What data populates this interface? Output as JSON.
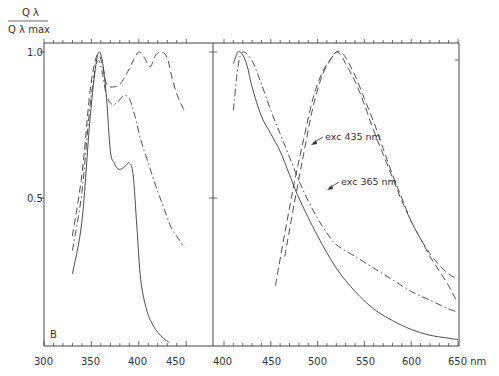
{
  "chart_data": {
    "type": "line",
    "title": "",
    "panel_label": "B",
    "ylabel": {
      "numerator": "Q λ",
      "denominator": "Q λ max"
    },
    "xlabel_unit": "nm",
    "yticks": [
      {
        "value": 1.0,
        "label": "1.0"
      },
      {
        "value": 0.5,
        "label": "0.5"
      }
    ],
    "ylim": [
      0,
      1.03
    ],
    "grid": false,
    "legend": "none (inline annotations)",
    "panels": [
      {
        "name": "excitation",
        "xlim": [
          300,
          460
        ],
        "xticks": [
          300,
          350,
          400,
          450
        ],
        "series": [
          {
            "name": "solid",
            "style": "solid",
            "x": [
              330,
              340,
              348,
              354,
              358,
              362,
              366,
              370,
              374,
              378,
              382,
              386,
              390,
              394,
              398,
              402,
              408,
              414,
              420,
              426,
              432
            ],
            "y": [
              0.24,
              0.42,
              0.75,
              0.94,
              1.0,
              0.96,
              0.84,
              0.66,
              0.62,
              0.6,
              0.6,
              0.61,
              0.62,
              0.58,
              0.4,
              0.22,
              0.12,
              0.07,
              0.04,
              0.02,
              0.005
            ]
          },
          {
            "name": "dashed",
            "style": "dashed",
            "x": [
              330,
              340,
              348,
              354,
              358,
              362,
              366,
              372,
              380,
              388,
              394,
              400,
              406,
              412,
              418,
              424,
              430,
              436,
              442,
              448
            ],
            "y": [
              0.37,
              0.58,
              0.85,
              0.97,
              0.99,
              0.95,
              0.89,
              0.88,
              0.89,
              0.93,
              0.97,
              1.0,
              0.98,
              0.95,
              0.99,
              1.0,
              0.98,
              0.9,
              0.84,
              0.8
            ]
          },
          {
            "name": "dash-dot",
            "style": "dash-dot",
            "x": [
              330,
              340,
              348,
              354,
              358,
              362,
              366,
              372,
              378,
              384,
              390,
              396,
              402,
              410,
              418,
              426,
              434,
              442,
              448
            ],
            "y": [
              0.32,
              0.52,
              0.8,
              0.94,
              0.97,
              0.92,
              0.85,
              0.82,
              0.83,
              0.85,
              0.84,
              0.78,
              0.7,
              0.62,
              0.54,
              0.47,
              0.4,
              0.36,
              0.33
            ]
          }
        ]
      },
      {
        "name": "emission",
        "xlim": [
          390,
          660
        ],
        "xticks": [
          400,
          450,
          500,
          550,
          600,
          650
        ],
        "series": [
          {
            "name": "solid",
            "style": "solid",
            "x": [
              410,
              415,
              420,
              425,
              430,
              440,
              450,
              460,
              470,
              480,
              500,
              520,
              540,
              560,
              580,
              600,
              620,
              640,
              650
            ],
            "y": [
              0.96,
              1.0,
              0.99,
              0.95,
              0.88,
              0.78,
              0.72,
              0.66,
              0.58,
              0.5,
              0.37,
              0.26,
              0.18,
              0.12,
              0.08,
              0.05,
              0.03,
              0.02,
              0.015
            ]
          },
          {
            "name": "exc 365 nm (dash-dot)",
            "style": "dash-dot",
            "x": [
              410,
              415,
              420,
              430,
              440,
              450,
              460,
              470,
              480,
              490,
              500,
              510,
              520,
              540,
              560,
              580,
              600,
              620,
              640,
              650
            ],
            "y": [
              0.8,
              0.95,
              1.0,
              0.97,
              0.89,
              0.8,
              0.72,
              0.64,
              0.56,
              0.49,
              0.43,
              0.38,
              0.34,
              0.3,
              0.26,
              0.22,
              0.18,
              0.15,
              0.12,
              0.11
            ]
          },
          {
            "name": "exc 435 nm (dashed)",
            "style": "dashed",
            "x": [
              465,
              475,
              485,
              495,
              505,
              515,
              520,
              525,
              530,
              540,
              550,
              560,
              570,
              580,
              590,
              600,
              610,
              620,
              630,
              640,
              648
            ],
            "y": [
              0.3,
              0.48,
              0.65,
              0.81,
              0.92,
              0.98,
              1.0,
              1.0,
              0.98,
              0.92,
              0.84,
              0.76,
              0.67,
              0.58,
              0.5,
              0.42,
              0.36,
              0.3,
              0.25,
              0.2,
              0.15
            ]
          },
          {
            "name": "dashed (second)",
            "style": "dashed",
            "x": [
              455,
              465,
              475,
              485,
              495,
              505,
              515,
              520,
              525,
              530,
              540,
              550,
              560,
              570,
              580,
              590,
              600,
              610,
              620,
              630,
              640,
              650
            ],
            "y": [
              0.2,
              0.38,
              0.55,
              0.7,
              0.84,
              0.93,
              0.98,
              1.0,
              0.99,
              0.96,
              0.9,
              0.82,
              0.73,
              0.65,
              0.57,
              0.49,
              0.42,
              0.36,
              0.31,
              0.27,
              0.24,
              0.22
            ]
          }
        ],
        "annotations": [
          {
            "text": "exc  435 nm",
            "x": 500,
            "y": 0.62
          },
          {
            "text": "exc  365 nm",
            "x": 515,
            "y": 0.46
          }
        ]
      }
    ]
  },
  "labels": {
    "panel_letter": "B",
    "y_num": "Q λ",
    "y_den": "Q λ max",
    "ytick_top": "1.0",
    "ytick_mid": "0.5",
    "x_left": [
      "300",
      "350",
      "400",
      "450"
    ],
    "x_right": [
      "400",
      "450",
      "500",
      "550",
      "600",
      "650 nm"
    ],
    "annot_435": "exc  435 nm",
    "annot_365": "exc  365 nm"
  },
  "colors": {
    "line": "#3a3a3a",
    "axis": "#444444",
    "background": "#ffffff"
  }
}
